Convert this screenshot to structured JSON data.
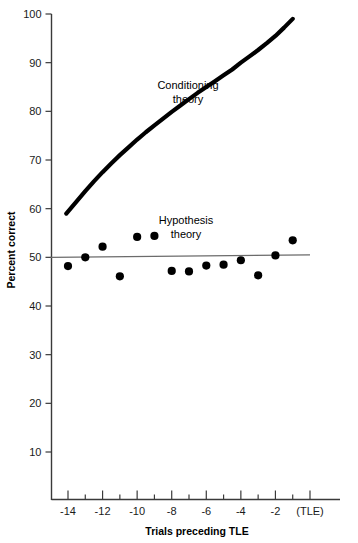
{
  "chart_data": {
    "type": "scatter",
    "title": "",
    "xlabel": "Trials preceding TLE",
    "ylabel": "Percent correct",
    "xlim": [
      -15,
      0.2
    ],
    "ylim": [
      0,
      100
    ],
    "grid": false,
    "legend_position": "inline-annotation",
    "y_ticks": [
      10,
      20,
      30,
      40,
      50,
      60,
      70,
      80,
      90,
      100
    ],
    "y_tick_labels": [
      "10",
      "20",
      "30",
      "40",
      "50",
      "60",
      "70",
      "80",
      "90",
      "100"
    ],
    "x_ticks": [
      -14,
      -13,
      -12,
      -11,
      -10,
      -9,
      -8,
      -7,
      -6,
      -5,
      -4,
      -3,
      -2,
      -1,
      0
    ],
    "x_tick_labels": [
      "-14",
      "",
      "-12",
      "",
      "-10",
      "",
      "-8",
      "",
      "-6",
      "",
      "-4",
      "",
      "-2",
      "",
      "(TLE)"
    ],
    "x_major_labels": [
      {
        "x": -14,
        "label": "-14"
      },
      {
        "x": -12,
        "label": "-12"
      },
      {
        "x": -10,
        "label": "-10"
      },
      {
        "x": -8,
        "label": "-8"
      },
      {
        "x": -6,
        "label": "-6"
      },
      {
        "x": -4,
        "label": "-4"
      },
      {
        "x": -2,
        "label": "-2"
      },
      {
        "x": 0,
        "label": "(TLE)"
      }
    ],
    "series": [
      {
        "name": "Hypothesis theory",
        "type": "line",
        "label": "Hypothesis theory",
        "label_lines": [
          "Hypothesis",
          "theory"
        ],
        "color": "#6b6b6b",
        "x": [
          -15,
          0
        ],
        "values": [
          50,
          50.5
        ]
      },
      {
        "name": "Conditioning theory",
        "type": "line",
        "label": "Conditioning theory",
        "label_lines": [
          "Conditioning",
          "theory"
        ],
        "color": "#000000",
        "x": [
          -14.1,
          -13.5,
          -13,
          -12.5,
          -12,
          -11.5,
          -11,
          -10.5,
          -10,
          -9.5,
          -9,
          -8.5,
          -8,
          -7.5,
          -7,
          -6.5,
          -6,
          -5.5,
          -5,
          -4.5,
          -4,
          -3.5,
          -3,
          -2.5,
          -2,
          -1.5,
          -1
        ],
        "values": [
          59.0,
          61.5,
          63.6,
          65.6,
          67.5,
          69.3,
          71.0,
          72.6,
          74.2,
          75.7,
          77.1,
          78.5,
          79.9,
          81.2,
          82.5,
          83.8,
          85.0,
          86.2,
          87.4,
          88.6,
          90.0,
          91.3,
          92.6,
          94.0,
          95.5,
          97.2,
          99.0
        ]
      },
      {
        "name": "Observed data",
        "type": "scatter",
        "color": "#000000",
        "points": [
          {
            "x": -14,
            "y": 48.2
          },
          {
            "x": -13,
            "y": 50.0
          },
          {
            "x": -12,
            "y": 52.2
          },
          {
            "x": -11,
            "y": 46.1
          },
          {
            "x": -10,
            "y": 54.2
          },
          {
            "x": -9,
            "y": 54.4
          },
          {
            "x": -8,
            "y": 47.2
          },
          {
            "x": -7,
            "y": 47.1
          },
          {
            "x": -6,
            "y": 48.3
          },
          {
            "x": -5,
            "y": 48.5
          },
          {
            "x": -4,
            "y": 49.4
          },
          {
            "x": -3,
            "y": 46.3
          },
          {
            "x": -2,
            "y": 50.4
          },
          {
            "x": -1,
            "y": 53.5
          }
        ]
      }
    ],
    "annotations": [
      {
        "name": "conditioning-theory-label",
        "lines": [
          "Conditioning",
          "theory"
        ],
        "x": 188,
        "y": 89
      },
      {
        "name": "hypothesis-theory-label",
        "lines": [
          "Hypothesis",
          "theory"
        ],
        "x": 186,
        "y": 224
      }
    ]
  }
}
